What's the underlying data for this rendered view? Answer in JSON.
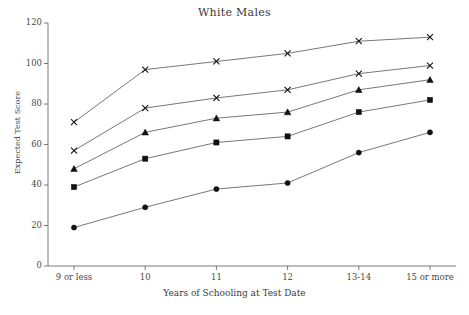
{
  "chart_data": {
    "type": "line",
    "title": "White Males",
    "xlabel": "Years of Schooling at Test Date",
    "ylabel": "Expected Test Score",
    "categories": [
      "9 or less",
      "10",
      "11",
      "12",
      "13-14",
      "15 or more"
    ],
    "ylim": [
      0,
      120
    ],
    "yticks": [
      0,
      20,
      40,
      60,
      80,
      100,
      120
    ],
    "grid": false,
    "legend": "none",
    "line_color": "#555555",
    "marker_color": "#111111",
    "series": [
      {
        "name": "series-1",
        "marker": "cross",
        "values": [
          71,
          97,
          101,
          105,
          111,
          113
        ]
      },
      {
        "name": "series-2",
        "marker": "cross",
        "values": [
          57,
          78,
          83,
          87,
          95,
          99
        ]
      },
      {
        "name": "series-3",
        "marker": "triangle",
        "values": [
          48,
          66,
          73,
          76,
          87,
          92
        ]
      },
      {
        "name": "series-4",
        "marker": "square",
        "values": [
          39,
          53,
          61,
          64,
          76,
          82
        ]
      },
      {
        "name": "series-5",
        "marker": "circle",
        "values": [
          19,
          29,
          38,
          41,
          56,
          66
        ]
      }
    ]
  }
}
